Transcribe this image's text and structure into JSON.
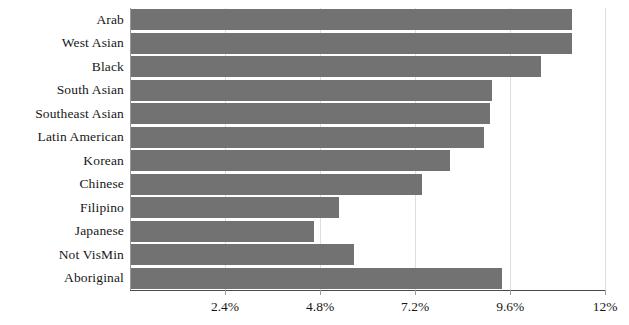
{
  "chart_data": {
    "type": "bar",
    "orientation": "horizontal",
    "title": "",
    "subtitle": "",
    "xlabel": "",
    "ylabel": "",
    "categories": [
      "Arab",
      "West Asian",
      "Black",
      "South Asian",
      "Southeast Asian",
      "Latin American",
      "Korean",
      "Chinese",
      "Filipino",
      "Japanese",
      "Not VisMin",
      "Aboriginal"
    ],
    "values": [
      11.14,
      11.14,
      10.35,
      9.11,
      9.06,
      8.91,
      8.06,
      7.36,
      5.25,
      4.61,
      5.64,
      9.37
    ],
    "value_format": "percent",
    "xlim": [
      0,
      12.6
    ],
    "xticks": [
      2.4,
      4.8,
      7.2,
      9.6,
      12
    ],
    "xtick_labels": [
      "2.4%",
      "4.8%",
      "7.2%",
      "9.6%",
      "12%"
    ],
    "grid": true,
    "grid_axis": "x",
    "legend": false,
    "legend_position": "none",
    "series": [
      {
        "name": "share",
        "color": "#727272",
        "values": [
          11.14,
          11.14,
          10.35,
          9.11,
          9.06,
          8.91,
          8.06,
          7.36,
          5.25,
          4.61,
          5.64,
          9.37
        ]
      }
    ]
  },
  "colors": {
    "bar": "#727272",
    "gridline": "#dedede",
    "axis_spine": "#9a9a9a",
    "axis_baseline": "#4a4a4a",
    "text": "#171717",
    "background": "#ffffff"
  }
}
